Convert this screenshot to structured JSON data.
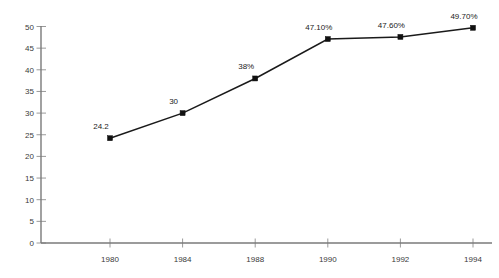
{
  "chart_data": {
    "type": "line",
    "title": "",
    "subtitle": "",
    "xlabel": "",
    "ylabel": "",
    "categories": [
      "1980",
      "1984",
      "1988",
      "1990",
      "1992",
      "1994"
    ],
    "x": [
      1980,
      1984,
      1988,
      1990,
      1992,
      1994
    ],
    "values": [
      24.2,
      30,
      38,
      47.1,
      47.6,
      49.7
    ],
    "point_labels": [
      "24.2",
      "30",
      "38%",
      "47.10%",
      "47.60%",
      "49.70%"
    ],
    "series": [
      {
        "name": "",
        "values": [
          24.2,
          30,
          38,
          47.1,
          47.6,
          49.7
        ]
      }
    ],
    "ylim": [
      0,
      50
    ],
    "y_ticks": [
      0,
      5,
      10,
      15,
      20,
      25,
      30,
      35,
      40,
      45,
      50
    ],
    "y_tick_labels": [
      "0",
      "5",
      "10",
      "15",
      "20",
      "25",
      "30",
      "35",
      "40",
      "45",
      "50"
    ],
    "x_tick_labels": [
      "1980",
      "1984",
      "1988",
      "1990",
      "1992",
      "1994"
    ],
    "grid": false,
    "legend": false,
    "legend_position": "none",
    "marker": "square",
    "line_color": "#1a1a1a",
    "axis_color": "#7a7a7a",
    "label_color": "#3a3a3a",
    "background": "#ffffff"
  }
}
